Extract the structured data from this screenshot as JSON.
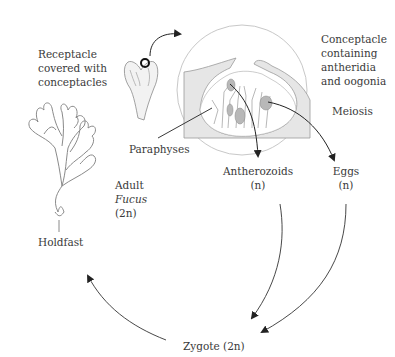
{
  "diagram": {
    "labels": {
      "receptacle": [
        "Receptacle",
        "covered with",
        "conceptacles"
      ],
      "conceptacle": [
        "Conceptacle",
        "containing",
        "antheridia",
        "and oogonia"
      ],
      "meiosis": "Meiosis",
      "paraphyses": "Paraphyses",
      "antherozoids": "Antherozoids",
      "antherozoids_ploidy": "(n)",
      "eggs": "Eggs",
      "eggs_ploidy": "(n)",
      "adult": "Adult",
      "adult_genus": "Fucus",
      "adult_ploidy": "(2n)",
      "holdfast": "Holdfast",
      "zygote": "Zygote (2n)"
    },
    "colors": {
      "line": "#333333",
      "outline": "#8a8a8a",
      "tissue_fill": "#e4e4e4",
      "gamete_fill": "#b8b8b8",
      "circle": "#c8c8c8"
    },
    "cycle": [
      {
        "from": "Receptacle",
        "to": "Conceptacle"
      },
      {
        "from": "Conceptacle",
        "to": "Antherozoids (n)"
      },
      {
        "from": "Conceptacle",
        "to": "Eggs (n)"
      },
      {
        "from": "Antherozoids (n)",
        "to": "Zygote (2n)"
      },
      {
        "from": "Eggs (n)",
        "to": "Zygote (2n)"
      },
      {
        "from": "Zygote (2n)",
        "to": "Adult Fucus (2n)"
      }
    ]
  }
}
